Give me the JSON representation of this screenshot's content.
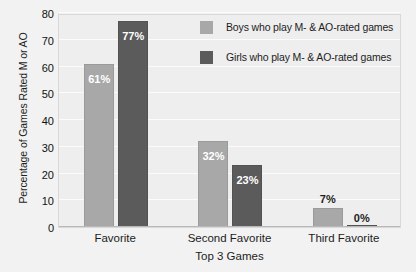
{
  "chart_data": {
    "type": "bar",
    "title": "",
    "xlabel": "Top 3 Games",
    "ylabel": "Percentage of Games Rated M or AO",
    "categories": [
      "Favorite",
      "Second Favorite",
      "Third Favorite"
    ],
    "series": [
      {
        "name": "Boys who play M- & AO-rated games",
        "color": "#a8a8a8",
        "values": [
          61,
          32,
          7
        ],
        "labels": [
          "61%",
          "32%",
          "7%"
        ]
      },
      {
        "name": "Girls who play M- & AO-rated games",
        "color": "#5b5b5b",
        "values": [
          77,
          23,
          0
        ],
        "labels": [
          "77%",
          "23%",
          "0%"
        ]
      }
    ],
    "ylim": [
      0,
      80
    ],
    "yticks": [
      0,
      10,
      20,
      30,
      40,
      50,
      60,
      70,
      80
    ],
    "ytick_labels": [
      "0",
      "10",
      "20",
      "30",
      "40",
      "50",
      "60",
      "70",
      "80"
    ],
    "grid": true,
    "legend_position": "top-right",
    "plot_background": "#eeeeee",
    "page_background": "#f2f2f2"
  },
  "axis": {
    "y_title": "Percentage of Games Rated M or AO",
    "x_title": "Top 3 Games"
  },
  "legend": {
    "items": [
      {
        "label": "Boys who play M- & AO-rated games"
      },
      {
        "label": "Girls who play M- & AO-rated games"
      }
    ]
  }
}
